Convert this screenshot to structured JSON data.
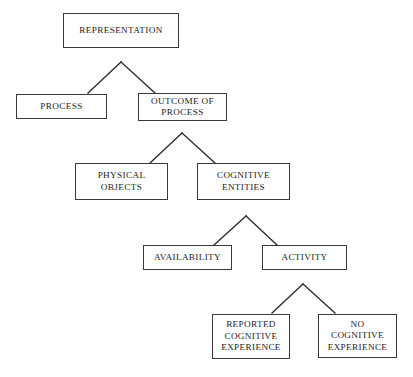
{
  "diagram": {
    "title": "REPRESENTATION",
    "type": "hierarchical tree diagram",
    "canvas": {
      "width": 413,
      "height": 377
    },
    "style": {
      "background_color": "#ffffff",
      "box_border_color": "#3a3a3a",
      "box_fill_color": "#ffffff",
      "text_color": "#1c1c1c",
      "connector_color": "#2e2e2e"
    },
    "nodes": [
      {
        "id": "representation",
        "label": "REPRESENTATION",
        "level": 0,
        "x": 63,
        "y": 13,
        "w": 116,
        "h": 35
      },
      {
        "id": "process",
        "label": "PROCESS",
        "level": 1,
        "x": 16,
        "y": 94,
        "w": 91,
        "h": 25
      },
      {
        "id": "outcome-of-process",
        "label": "OUTCOME OF\nPROCESS",
        "level": 1,
        "x": 138,
        "y": 93,
        "w": 89,
        "h": 28
      },
      {
        "id": "physical-objects",
        "label": "PHYSICAL\nOBJECTS",
        "level": 2,
        "x": 75,
        "y": 163,
        "w": 93,
        "h": 37
      },
      {
        "id": "cognitive-entities",
        "label": "COGNITIVE\nENTITIES",
        "level": 2,
        "x": 197,
        "y": 163,
        "w": 93,
        "h": 37
      },
      {
        "id": "availability",
        "label": "AVAILABILITY",
        "level": 3,
        "x": 143,
        "y": 245,
        "w": 89,
        "h": 25
      },
      {
        "id": "activity",
        "label": "ACTIVITY",
        "level": 3,
        "x": 262,
        "y": 245,
        "w": 85,
        "h": 25
      },
      {
        "id": "reported-cognitive-experience",
        "label": "REPORTED\nCOGNITIVE\nEXPERIENCE",
        "level": 4,
        "x": 212,
        "y": 314,
        "w": 78,
        "h": 45
      },
      {
        "id": "no-cognitive-experience",
        "label": "NO\nCOGNITIVE\nEXPERIENCE",
        "level": 4,
        "x": 318,
        "y": 314,
        "w": 79,
        "h": 44
      }
    ],
    "connectors": [
      {
        "id": "representation-split",
        "from": "representation",
        "to": [
          "process",
          "outcome-of-process"
        ],
        "apex": {
          "x": 121,
          "y": 62
        },
        "left_end": {
          "x": 88,
          "y": 93
        },
        "right_end": {
          "x": 155,
          "y": 93
        }
      },
      {
        "id": "outcome-split",
        "from": "outcome-of-process",
        "to": [
          "physical-objects",
          "cognitive-entities"
        ],
        "apex": {
          "x": 182,
          "y": 133
        },
        "left_end": {
          "x": 150,
          "y": 163
        },
        "right_end": {
          "x": 215,
          "y": 163
        }
      },
      {
        "id": "cognitive-entities-split",
        "from": "cognitive-entities",
        "to": [
          "availability",
          "activity"
        ],
        "apex": {
          "x": 246,
          "y": 216
        },
        "left_end": {
          "x": 214,
          "y": 245
        },
        "right_end": {
          "x": 277,
          "y": 245
        }
      },
      {
        "id": "activity-split",
        "from": "activity",
        "to": [
          "reported-cognitive-experience",
          "no-cognitive-experience"
        ],
        "apex": {
          "x": 303,
          "y": 284
        },
        "left_end": {
          "x": 272,
          "y": 313
        },
        "right_end": {
          "x": 335,
          "y": 313
        }
      }
    ]
  }
}
